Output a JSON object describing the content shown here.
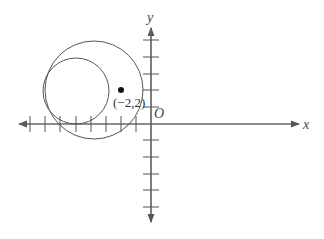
{
  "diagram": {
    "type": "coordinate-plane",
    "axes": {
      "x_label": "x",
      "y_label": "y",
      "origin_label": "O",
      "x_ticks": [
        -8,
        -7,
        -6,
        -5,
        -4,
        -3,
        -2,
        -1
      ],
      "y_ticks": [
        5,
        4,
        3,
        2,
        1,
        -1,
        -2,
        -3,
        -4,
        -5
      ]
    },
    "point": {
      "label": "(−2,2)",
      "x": -2,
      "y": 2
    },
    "circles": [
      {
        "name": "large-circle",
        "note": "passes near point (-2,2)"
      },
      {
        "name": "small-circle",
        "note": "inside large circle, tangent at left"
      }
    ],
    "colors": {
      "stroke": "#555555",
      "background": "#ffffff"
    }
  }
}
